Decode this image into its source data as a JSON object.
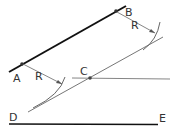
{
  "diagram": {
    "labels": {
      "A": "A",
      "B": "B",
      "C": "C",
      "D": "D",
      "E": "E",
      "R1": "R",
      "R2": "R"
    },
    "colors": {
      "thick_line": "#111111",
      "thin_line": "#555555",
      "text": "#333333",
      "background": "#ffffff"
    },
    "points": {
      "A": [
        22,
        63
      ],
      "B": [
        116,
        11
      ],
      "C": [
        89,
        78
      ]
    },
    "lines": {
      "AB": [
        [
          9,
          72
        ],
        [
          126,
          6
        ]
      ],
      "parallel": [
        [
          28,
          112
        ],
        [
          163,
          37
        ]
      ],
      "horizontal_through_C": [
        [
          72,
          78
        ],
        [
          170,
          79
        ]
      ],
      "DE": [
        [
          9,
          124
        ],
        [
          158,
          125
        ]
      ]
    }
  }
}
